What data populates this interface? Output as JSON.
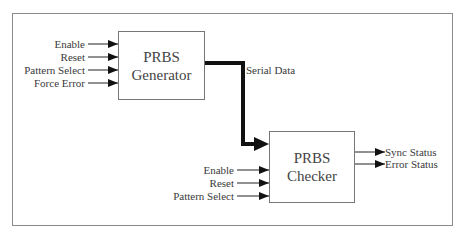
{
  "diagram": {
    "generator": {
      "title_line1": "PRBS",
      "title_line2": "Generator",
      "inputs": [
        "Enable",
        "Reset",
        "Pattern Select",
        "Force Error"
      ]
    },
    "link": {
      "label": "Serial Data"
    },
    "checker": {
      "title_line1": "PRBS",
      "title_line2": "Checker",
      "inputs": [
        "Enable",
        "Reset",
        "Pattern Select"
      ],
      "outputs": [
        "Sync Status",
        "Error Status"
      ]
    },
    "colors": {
      "frame": "#8a8a8a",
      "box_border": "#777777",
      "wire": "#111111",
      "text": "#3a3a3a"
    }
  }
}
